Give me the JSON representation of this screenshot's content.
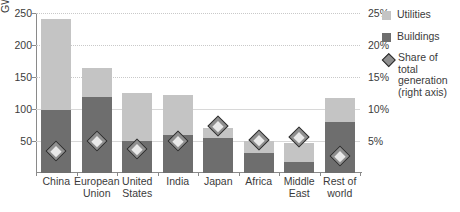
{
  "chart_data": {
    "type": "bar",
    "title": "",
    "subtitle": "",
    "xlabel": "",
    "ylabel": "GW",
    "ylim": [
      0,
      250
    ],
    "yticks": [
      50,
      100,
      150,
      200,
      250
    ],
    "ytick_labels": [
      "50",
      "100",
      "150",
      "200",
      "250"
    ],
    "y2label": "",
    "y2lim": [
      0,
      25
    ],
    "y2ticks": [
      5,
      10,
      15,
      20,
      25
    ],
    "y2tick_labels": [
      "5%",
      "10%",
      "15%",
      "20%",
      "25%"
    ],
    "grid": true,
    "legend_position": "right",
    "stacked": true,
    "categories": [
      "China",
      "European Union",
      "United States",
      "India",
      "Japan",
      "Africa",
      "Middle East",
      "Rest of world"
    ],
    "series": [
      {
        "name": "Buildings",
        "color": "#6e6e6e",
        "axis": "left",
        "values": [
          98,
          118,
          50,
          60,
          55,
          32,
          17,
          79
        ]
      },
      {
        "name": "Utilities",
        "color": "#c4c4c4",
        "axis": "left",
        "values": [
          142,
          46,
          75,
          62,
          15,
          18,
          30,
          38
        ]
      },
      {
        "name": "Share of total generation (right axis)",
        "color": "#8f8f8f",
        "axis": "right",
        "marker": "diamond",
        "values": [
          3.5,
          5.0,
          3.7,
          5.0,
          7.3,
          5.2,
          5.7,
          2.7
        ]
      }
    ],
    "totals": [
      240,
      164,
      125,
      122,
      70,
      50,
      47,
      117
    ]
  },
  "legend": {
    "items": [
      {
        "label": "Utilities",
        "marker": "square-light"
      },
      {
        "label": "Buildings",
        "marker": "square-dark"
      },
      {
        "label": "Share of total generation (right axis)",
        "marker": "diamond"
      }
    ]
  },
  "colors": {
    "utilities": "#c4c4c4",
    "buildings": "#6e6e6e",
    "marker_fill": "#8f8f8f",
    "marker_edge": "#2b2b2b",
    "axis": "#8a8a8a",
    "grid": "#c9c9c9",
    "text": "#3b3b3b",
    "background": "#ffffff"
  }
}
